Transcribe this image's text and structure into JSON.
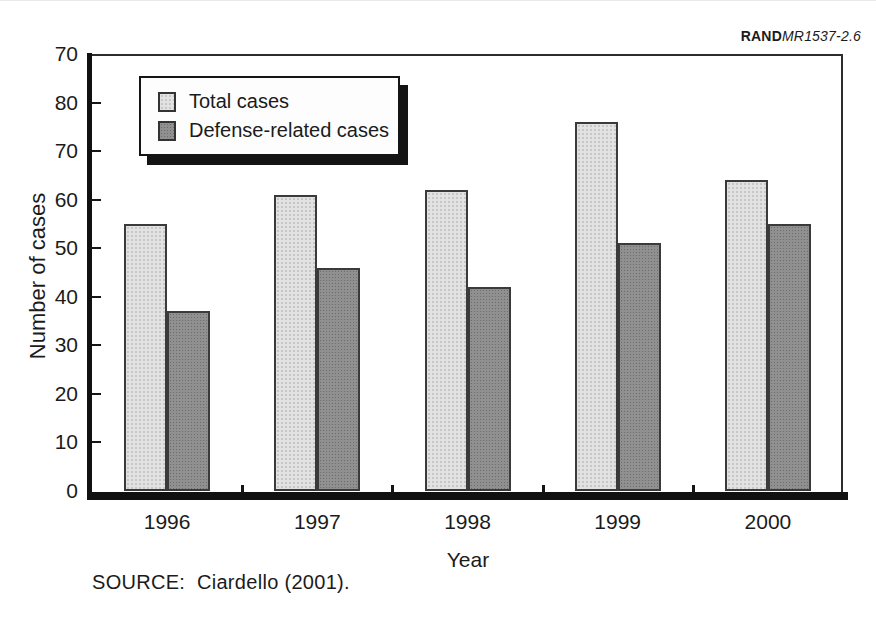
{
  "branding": {
    "publisher": "RAND",
    "doc_ref": "MR1537-2.6"
  },
  "source_note": "SOURCE:  Ciardello (2001).",
  "chart_data": {
    "type": "bar",
    "categories": [
      "1996",
      "1997",
      "1998",
      "1999",
      "2000"
    ],
    "series": [
      {
        "name": "Total cases",
        "key": "total",
        "values": [
          55,
          61,
          62,
          76,
          64
        ]
      },
      {
        "name": "Defense-related cases",
        "key": "defense",
        "values": [
          37,
          46,
          42,
          51,
          55
        ]
      }
    ],
    "xlabel": "Year",
    "ylabel": "Number of cases",
    "ylim": [
      0,
      90
    ],
    "y_tick_step": 10,
    "y_tick_labels_top_to_bottom": [
      "70",
      "80",
      "70",
      "60",
      "50",
      "40",
      "30",
      "20",
      "10",
      "0"
    ],
    "grid": false,
    "legend_position": "top-left-inside"
  },
  "colors": {
    "total_fill": "#e2e2e2",
    "total_dot": "#c6c6c6",
    "defense_fill": "#909090",
    "defense_dot": "#6c6c6c",
    "bar_border": "#3a3a3a",
    "axis": "#141414",
    "text": "#1b1b1b",
    "legend_shadow": "#141414"
  }
}
